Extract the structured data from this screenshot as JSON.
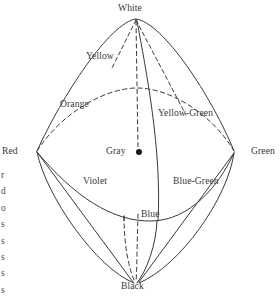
{
  "figure": {
    "type": "color-solid-diagram",
    "stroke_color": "#3a3a3a",
    "label_color": "#3a3a3a",
    "background_color": "#ffffff",
    "center_dot_color": "#1a1a1a",
    "vertices": {
      "white": {
        "label": "White",
        "x": 136,
        "y": 18
      },
      "black": {
        "label": "Black",
        "x": 136,
        "y": 283
      },
      "red": {
        "label": "Red",
        "x": 37,
        "y": 152
      },
      "green": {
        "label": "Green",
        "x": 234,
        "y": 152
      },
      "gray": {
        "label": "Gray",
        "x": 139,
        "y": 152
      }
    },
    "labels": [
      {
        "key": "white",
        "text": "White"
      },
      {
        "key": "yellow",
        "text": "Yellow"
      },
      {
        "key": "orange",
        "text": "Orange"
      },
      {
        "key": "yellow_green",
        "text": "Yellow-Green"
      },
      {
        "key": "red",
        "text": "Red"
      },
      {
        "key": "green",
        "text": "Green"
      },
      {
        "key": "gray",
        "text": "Gray"
      },
      {
        "key": "violet",
        "text": "Violet"
      },
      {
        "key": "blue_green",
        "text": "Blue-Green"
      },
      {
        "key": "blue",
        "text": "Blue"
      },
      {
        "key": "black",
        "text": "Black"
      }
    ]
  },
  "gutter_text": {
    "lines": [
      "r",
      "d",
      "o",
      "s",
      "s",
      "s",
      "s",
      "s"
    ]
  }
}
